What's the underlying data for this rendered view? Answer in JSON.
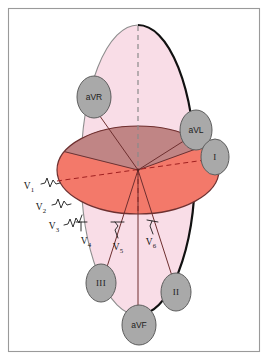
{
  "figure": {
    "frame_color": "#9a9a9a",
    "background": "#ffffff"
  },
  "colors": {
    "frontal_plane_fill": "#f9dde7",
    "frontal_plane_stroke_left": "#8d8d8d",
    "frontal_plane_stroke_right": "#111111",
    "horizontal_plane_dark": "#c08585",
    "horizontal_plane_light": "#f3796a",
    "horizontal_plane_stroke": "#6e3030",
    "label_ellipse_fill": "#a9a9a9",
    "label_ellipse_stroke": "#5d5d5d",
    "axis_line": "#6e2f2f",
    "dashed_vertical": "#8a8a8a",
    "dashed_red": "#a02020",
    "text": "#1c1c1c"
  },
  "limb_leads": [
    {
      "id": "aVR",
      "label": "aVR",
      "cx": 94,
      "cy": 97,
      "rx": 17,
      "ry": 21,
      "style": "sans"
    },
    {
      "id": "aVL",
      "label": "aVL",
      "cx": 196,
      "cy": 130,
      "rx": 16,
      "ry": 20,
      "style": "sans"
    },
    {
      "id": "I",
      "label": "I",
      "cx": 215,
      "cy": 157,
      "rx": 14,
      "ry": 18,
      "style": "roman"
    },
    {
      "id": "II",
      "label": "II",
      "cx": 176,
      "cy": 292,
      "rx": 15,
      "ry": 19,
      "style": "roman"
    },
    {
      "id": "III",
      "label": "III",
      "cx": 101,
      "cy": 283,
      "rx": 15,
      "ry": 19,
      "style": "roman"
    },
    {
      "id": "aVF",
      "label": "aVF",
      "cx": 139,
      "cy": 325,
      "rx": 17,
      "ry": 20,
      "style": "sans"
    }
  ],
  "precordial_leads": [
    {
      "id": "V1",
      "label": "V",
      "sub": "1",
      "x": 29,
      "y": 187
    },
    {
      "id": "V2",
      "label": "V",
      "sub": "2",
      "x": 41,
      "y": 208
    },
    {
      "id": "V3",
      "label": "V",
      "sub": "3",
      "x": 54,
      "y": 227
    },
    {
      "id": "V4",
      "label": "V",
      "sub": "4",
      "x": 86,
      "y": 242
    },
    {
      "id": "V5",
      "label": "V",
      "sub": "5",
      "x": 118,
      "y": 248
    },
    {
      "id": "V6",
      "label": "V",
      "sub": "6",
      "x": 151,
      "y": 243
    }
  ],
  "geometry": {
    "center_x": 138,
    "center_y": 170,
    "frontal_rx": 57,
    "frontal_ry": 145,
    "horizontal_rx": 81,
    "horizontal_ry": 44
  }
}
